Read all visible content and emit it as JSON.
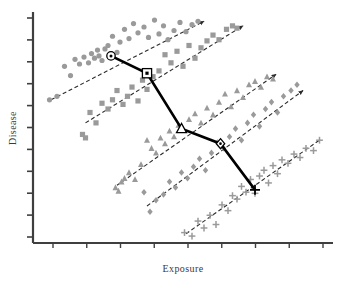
{
  "figure": {
    "background_color": "#ffffff",
    "width": 341,
    "height": 286
  },
  "axes": {
    "x_label": "Exposure",
    "y_label": "Disease",
    "axis_color": "#3f3f3f",
    "x_tick_count": 9,
    "y_tick_count": 11,
    "ticks_labeled": false,
    "grid": false
  },
  "styles": {
    "point_color": "#9a9a9a",
    "group_trend_color": "#2b2b2b",
    "overall_trend_color": "#000000",
    "marker_outline_color": "#000000"
  },
  "chart_data": {
    "type": "scatter",
    "title": "",
    "subtitle": "",
    "xlabel": "Exposure",
    "ylabel": "Disease",
    "xlim": [
      0,
      100
    ],
    "ylim": [
      0,
      100
    ],
    "grid": false,
    "legend_position": "none",
    "annotations": [
      "Within-group dashed trend lines are positive for all five groups",
      "Thick solid line connecting group centroids is negative (Simpson's paradox)"
    ],
    "series": [
      {
        "name": "Group 1",
        "marker": "circle",
        "color": "#9a9a9a",
        "centroid_marker": "circle-outline",
        "centroid": [
          26.0,
          81.0
        ],
        "trend_line": {
          "x": [
            6.0,
            57.0
          ],
          "y": [
            62.0,
            96.0
          ],
          "style": "dashed",
          "arrow": "end"
        },
        "x": [
          5.5,
          8.0,
          10.5,
          12.5,
          14.0,
          15.5,
          17.0,
          18.5,
          19.5,
          20.5,
          21.5,
          22.0,
          23.0,
          24.0,
          25.0,
          26.5,
          28.0,
          29.0,
          30.5,
          32.0,
          33.5,
          35.0,
          37.0,
          38.5,
          40.5,
          42.0,
          43.5,
          45.0,
          47.0,
          49.0,
          51.0,
          53.0,
          55.0
        ],
        "y": [
          62.0,
          63.5,
          76.5,
          72.5,
          79.5,
          77.5,
          80.5,
          78.0,
          82.0,
          80.0,
          83.5,
          81.0,
          79.0,
          84.0,
          85.5,
          89.5,
          82.5,
          87.0,
          92.5,
          88.5,
          95.0,
          91.0,
          93.5,
          89.0,
          96.5,
          90.5,
          94.0,
          88.0,
          92.0,
          95.5,
          91.5,
          94.5,
          96.0
        ]
      },
      {
        "name": "Group 2",
        "marker": "square",
        "color": "#9a9a9a",
        "centroid_marker": "square-outline",
        "centroid": [
          38.0,
          73.5
        ],
        "trend_line": {
          "x": [
            17.5,
            70.0
          ],
          "y": [
            52.0,
            94.0
          ],
          "style": "dashed",
          "arrow": "end"
        },
        "x": [
          16.5,
          17.5,
          19.0,
          21.0,
          23.0,
          25.0,
          26.5,
          28.0,
          30.0,
          31.5,
          33.0,
          35.0,
          36.5,
          38.0,
          40.0,
          42.0,
          44.0,
          46.0,
          48.0,
          50.0,
          52.0,
          54.0,
          56.0,
          58.0,
          60.0,
          62.0,
          64.5,
          66.5,
          68.0
        ],
        "y": [
          47.0,
          45.5,
          56.5,
          52.0,
          60.5,
          58.0,
          62.0,
          66.0,
          60.0,
          63.5,
          67.5,
          61.5,
          70.5,
          66.5,
          72.0,
          74.5,
          81.5,
          78.0,
          83.0,
          76.5,
          85.5,
          80.0,
          84.5,
          87.5,
          90.0,
          88.0,
          92.5,
          94.0,
          93.0
        ]
      },
      {
        "name": "Group 3",
        "marker": "triangle",
        "color": "#9a9a9a",
        "centroid_marker": "triangle-outline",
        "centroid": [
          49.5,
          49.5
        ],
        "trend_line": {
          "x": [
            28.0,
            81.0
          ],
          "y": [
            25.0,
            73.0
          ],
          "style": "dashed",
          "arrow": "end"
        },
        "x": [
          27.5,
          28.5,
          29.5,
          30.5,
          32.0,
          34.0,
          36.0,
          38.0,
          39.5,
          41.0,
          42.5,
          44.0,
          45.5,
          47.0,
          48.5,
          50.0,
          52.0,
          54.0,
          56.0,
          58.0,
          60.0,
          62.0,
          64.0,
          66.0,
          68.0,
          70.0,
          72.0,
          74.0,
          76.0,
          78.0,
          80.0
        ],
        "y": [
          24.0,
          22.5,
          26.5,
          28.0,
          30.5,
          27.5,
          34.0,
          44.5,
          41.0,
          39.0,
          45.5,
          43.0,
          48.5,
          46.0,
          51.0,
          49.0,
          53.5,
          56.0,
          52.0,
          58.5,
          55.5,
          61.0,
          64.5,
          59.0,
          66.0,
          63.0,
          68.5,
          70.0,
          67.5,
          72.0,
          71.0
        ]
      },
      {
        "name": "Group 4",
        "marker": "diamond",
        "color": "#9a9a9a",
        "centroid_marker": "diamond-outline",
        "centroid": [
          62.5,
          43.0
        ],
        "trend_line": {
          "x": [
            38.0,
            90.0
          ],
          "y": [
            16.0,
            66.0
          ],
          "style": "dashed",
          "arrow": "end"
        },
        "x": [
          37.0,
          39.0,
          41.0,
          43.5,
          45.5,
          47.5,
          49.5,
          51.5,
          53.5,
          55.5,
          57.5,
          59.5,
          61.5,
          63.5,
          65.5,
          67.5,
          69.5,
          71.5,
          73.5,
          75.5,
          77.5,
          79.5,
          81.5,
          83.5,
          86.0,
          88.0
        ],
        "y": [
          22.0,
          13.5,
          18.5,
          21.0,
          26.5,
          24.0,
          30.5,
          28.0,
          33.0,
          36.5,
          31.5,
          39.0,
          43.5,
          41.0,
          46.0,
          49.5,
          44.5,
          52.0,
          55.5,
          50.5,
          58.0,
          61.0,
          56.5,
          63.5,
          66.0,
          68.5
        ]
      },
      {
        "name": "Group 5",
        "marker": "plus",
        "color": "#9a9a9a",
        "centroid_marker": "plus-outline",
        "centroid": [
          74.0,
          23.0
        ],
        "trend_line": {
          "x": [
            51.0,
            96.0
          ],
          "y": [
            4.0,
            45.0
          ],
          "style": "dashed",
          "arrow": "none"
        },
        "x": [
          50.5,
          53.0,
          55.0,
          57.0,
          59.0,
          61.0,
          63.0,
          65.0,
          66.5,
          68.0,
          69.5,
          71.0,
          72.5,
          74.0,
          75.5,
          77.0,
          78.5,
          80.0,
          81.5,
          83.0,
          85.0,
          87.0,
          89.0,
          91.0,
          93.5,
          95.5
        ],
        "y": [
          4.5,
          3.0,
          9.5,
          6.5,
          12.0,
          8.0,
          16.5,
          14.0,
          20.5,
          19.0,
          24.5,
          22.0,
          27.5,
          21.5,
          29.0,
          31.5,
          26.0,
          33.5,
          30.0,
          36.0,
          34.5,
          38.5,
          37.0,
          41.0,
          40.0,
          44.5
        ]
      }
    ],
    "overall_trend": {
      "name": "Overall trend through group centroids",
      "style": "solid-thick",
      "color": "#000000",
      "points": [
        [
          26.0,
          81.0
        ],
        [
          38.0,
          73.5
        ],
        [
          49.5,
          49.5
        ],
        [
          62.5,
          43.0
        ],
        [
          74.0,
          23.0
        ]
      ]
    }
  }
}
